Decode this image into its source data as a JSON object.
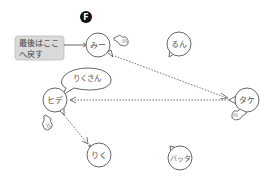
{
  "diagram": {
    "type": "speech-network",
    "step_badge": "F",
    "callout": {
      "lines": [
        "最後はここ",
        "へ戻す"
      ],
      "points_to": "mi"
    },
    "speech_bubble": {
      "text": "りくさん",
      "speaker": "hide"
    },
    "nodes": [
      {
        "id": "mi",
        "label": "みー"
      },
      {
        "id": "run",
        "label": "るん"
      },
      {
        "id": "hide",
        "label": "ヒデ"
      },
      {
        "id": "take",
        "label": "タケ"
      },
      {
        "id": "riku",
        "label": "りく"
      },
      {
        "id": "batta",
        "label": "バッタ"
      }
    ],
    "edges": [
      {
        "from": "mi",
        "to": "take",
        "style": "dotted",
        "arrow": true
      },
      {
        "from": "take",
        "to": "hide",
        "style": "dotted",
        "arrow": true
      },
      {
        "from": "hide",
        "to": "riku",
        "style": "dotted",
        "arrow": true
      }
    ],
    "hand_icons": [
      "mi",
      "hide",
      "take"
    ],
    "colors": {
      "stroke": "#555555",
      "callout_fill": "#d9d9d9",
      "badge_fill": "#111111"
    }
  }
}
